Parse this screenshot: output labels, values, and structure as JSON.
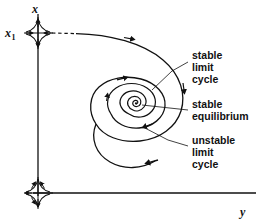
{
  "figure": {
    "type": "phase-portrait-diagram",
    "background_color": "#ffffff",
    "stroke_color": "#111111"
  },
  "axes": {
    "x_label": "x",
    "x_tick_label": "x",
    "x_tick_sub": "1",
    "y_label": "y",
    "vertical_axis_name": "x-axis",
    "horizontal_axis_name": "y-axis"
  },
  "annotations": [
    {
      "id": "stable-limit-cycle",
      "lines": [
        "stable",
        "limit",
        "cycle"
      ],
      "line1": "stable",
      "line2": "limit",
      "line3": "cycle"
    },
    {
      "id": "stable-equilibrium",
      "lines": [
        "stable",
        "equilibrium"
      ],
      "line1": "stable",
      "line2": "equilibrium"
    },
    {
      "id": "unstable-limit-cycle",
      "lines": [
        "unstable",
        "limit",
        "cycle"
      ],
      "line1": "unstable",
      "line2": "limit",
      "line3": "cycle"
    }
  ],
  "features": {
    "saddle_upper": {
      "name": "saddle-point-x1",
      "position": [
        38,
        33
      ],
      "description": "saddle point on x axis at x1"
    },
    "saddle_lower": {
      "name": "saddle-point-origin",
      "position": [
        38,
        193
      ],
      "description": "saddle point at origin"
    },
    "equilibrium": {
      "name": "stable-equilibrium-point",
      "position": [
        136,
        111
      ]
    },
    "separatrix": {
      "name": "separatrix-trajectory",
      "style": "dashed-then-solid"
    }
  }
}
